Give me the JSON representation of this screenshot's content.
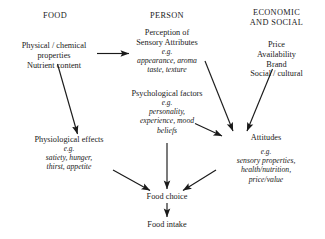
{
  "diagram": {
    "columns": [
      {
        "id": "food",
        "heading": "FOOD"
      },
      {
        "id": "person",
        "heading": "PERSON"
      },
      {
        "id": "economic",
        "heading_line1": "ECONOMIC",
        "heading_line2": "AND SOCIAL"
      }
    ],
    "nodes": {
      "food_props": {
        "line1": "Physical / chemical",
        "line2": "properties",
        "line3": "Nutrient content"
      },
      "economic_items": {
        "line1": "Price",
        "line2": "Availability",
        "line3": "Brand",
        "line4": "Social / cultural"
      },
      "perception": {
        "line1": "Perception of",
        "line2": "Sensory Attributes",
        "eg": "e.g.",
        "ital1": "appearance, aroma",
        "ital2": "taste, texture"
      },
      "psychological": {
        "line1": "Psychological factors",
        "eg": "e.g.",
        "ital1": "personality,",
        "ital2": "experience, mood",
        "ital3": "beliefs"
      },
      "physiological": {
        "line1": "Physiological effects",
        "eg": "e.g.",
        "ital1": "satiety, hunger,",
        "ital2": "thirst, appetite"
      },
      "attitudes": {
        "line1": "Attitudes",
        "eg": "e.g.",
        "ital1": "sensory properties,",
        "ital2": "health/nutrition,",
        "ital3": "price/value"
      },
      "food_choice": {
        "label": "Food choice"
      },
      "food_intake": {
        "label": "Food intake"
      }
    },
    "edges": [
      {
        "id": "food-to-perception",
        "from": "food_props",
        "to": "perception"
      },
      {
        "id": "food-to-physiological",
        "from": "food_props",
        "to": "physiological"
      },
      {
        "id": "perception-to-attitudes",
        "from": "perception",
        "to": "attitudes"
      },
      {
        "id": "economic-to-attitudes",
        "from": "economic_items",
        "to": "attitudes"
      },
      {
        "id": "psychological-to-attitudes",
        "from": "psychological",
        "to": "attitudes"
      },
      {
        "id": "psychological-to-food-choice",
        "from": "psychological",
        "to": "food_choice"
      },
      {
        "id": "physiological-to-food-choice",
        "from": "physiological",
        "to": "food_choice"
      },
      {
        "id": "attitudes-to-food-choice",
        "from": "attitudes",
        "to": "food_choice"
      },
      {
        "id": "food-choice-to-food-intake",
        "from": "food_choice",
        "to": "food_intake"
      }
    ],
    "style": {
      "background": "#ffffff",
      "text_color": "#1a1a1a",
      "arrow_color": "#1a1a1a"
    }
  }
}
